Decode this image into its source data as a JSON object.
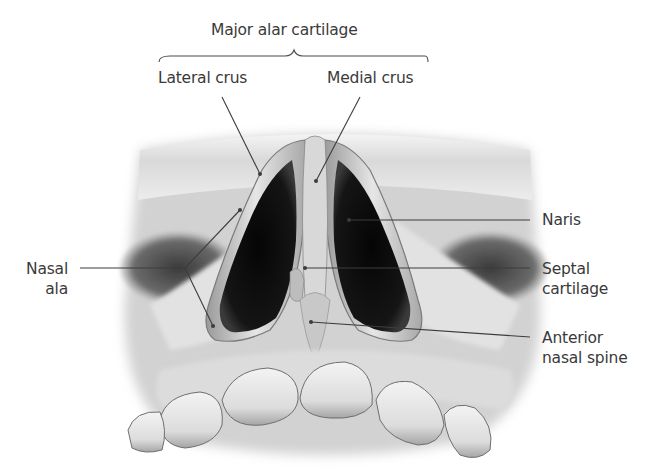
{
  "figure": {
    "group_label": "Major alar cartilage",
    "labels": [
      {
        "id": "lateral-crus",
        "lines": [
          "Lateral crus"
        ]
      },
      {
        "id": "medial-crus",
        "lines": [
          "Medial crus"
        ]
      },
      {
        "id": "naris",
        "lines": [
          "Naris"
        ]
      },
      {
        "id": "septal-cartilage",
        "lines": [
          "Septal",
          "cartilage"
        ]
      },
      {
        "id": "anterior-nasal-spine",
        "lines": [
          "Anterior",
          "nasal spine"
        ]
      },
      {
        "id": "nasal-ala",
        "lines": [
          "Nasal",
          "ala"
        ]
      }
    ]
  }
}
